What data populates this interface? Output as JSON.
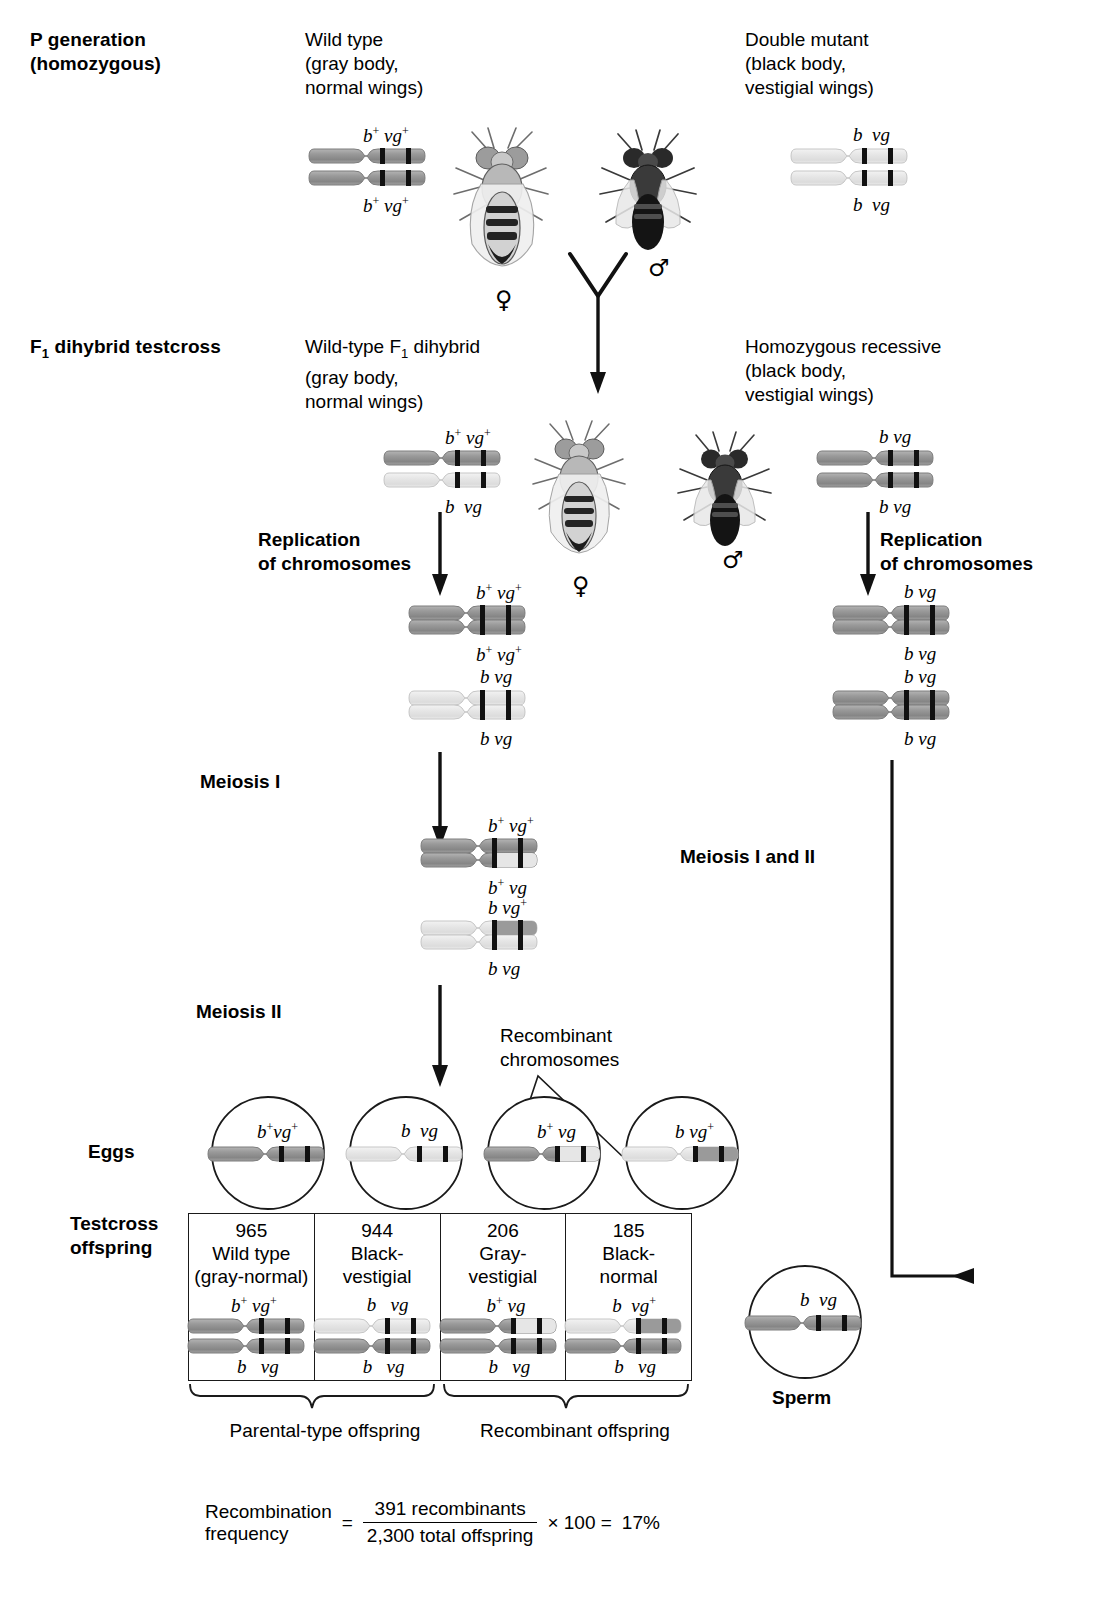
{
  "stages": {
    "p_generation": "P generation\n(homozygous)",
    "p_generation_line1": "P generation",
    "p_generation_line2": "(homozygous)",
    "f1_testcross": "F1 dihybrid testcross",
    "f1_testcross_sub": "1",
    "f1_testcross_pre": "F",
    "f1_testcross_post": " dihybrid testcross"
  },
  "p_gen": {
    "left": {
      "caption_lines": [
        "Wild type",
        "(gray body,",
        "normal wings)"
      ],
      "chromosome_top_label": "b+ vg+",
      "chromosome_bottom_label": "b+ vg+",
      "sex_symbol": "♀",
      "sex_name": "female"
    },
    "right": {
      "caption_lines": [
        "Double mutant",
        "(black body,",
        "vestigial wings)"
      ],
      "chromosome_top_label": "b  vg",
      "chromosome_bottom_label": "b  vg",
      "sex_symbol": "♂",
      "sex_name": "male"
    }
  },
  "f1": {
    "left": {
      "caption_lines": [
        "Wild-type F1 dihybrid",
        "(gray body,",
        "normal wings)"
      ],
      "caption_pre": "Wild-type F",
      "caption_sub": "1",
      "caption_post": " dihybrid",
      "chromosome_top_label": "b+ vg+",
      "chromosome_bottom_label": "b  vg",
      "sex_symbol": "♀"
    },
    "right": {
      "caption_lines": [
        "Homozygous recessive",
        "(black body,",
        "vestigial wings)"
      ],
      "chromosome_top_label": "b vg",
      "chromosome_bottom_label": "b vg",
      "sex_symbol": "♂"
    }
  },
  "steps": {
    "replication_left": [
      "Replication",
      "of chromosomes"
    ],
    "replication_right": [
      "Replication",
      "of chromosomes"
    ],
    "meiosis_i": "Meiosis I",
    "meiosis_ii": "Meiosis II",
    "meiosis_i_and_ii": "Meiosis I and II",
    "recombinant_note": [
      "Recombinant",
      "chromosomes"
    ]
  },
  "replicated_left": {
    "pair1_top": "b+ vg+",
    "pair1_bottom": "b+ vg+",
    "pair2_top": "b vg",
    "pair2_bottom": "b vg"
  },
  "replicated_right": {
    "pair1_top": "b vg",
    "pair1_bottom": "b vg",
    "pair2_top": "b vg",
    "pair2_bottom": "b vg"
  },
  "after_meiosis_i": {
    "pair1_top": "b+ vg+",
    "pair1_bottom": "b+ vg",
    "pair2_top": "b vg+",
    "pair2_bottom": "b vg"
  },
  "eggs": {
    "label": "Eggs",
    "cells": [
      {
        "genotype": "b+vg+",
        "type": "parental"
      },
      {
        "genotype": "b  vg",
        "type": "parental"
      },
      {
        "genotype": "b+ vg",
        "type": "recombinant"
      },
      {
        "genotype": "b vg+",
        "type": "recombinant"
      }
    ]
  },
  "sperm": {
    "label": "Sperm",
    "genotype": "b  vg"
  },
  "testcross": {
    "label_lines": [
      "Testcross",
      "offspring"
    ],
    "columns": [
      {
        "count": "965",
        "name_lines": [
          "Wild type",
          "(gray-normal)"
        ],
        "top_label": "b+ vg+",
        "bottom_label": "b   vg",
        "group": "parental"
      },
      {
        "count": "944",
        "name_lines": [
          "Black-",
          "vestigial"
        ],
        "top_label": "b   vg",
        "bottom_label": "b   vg",
        "group": "parental"
      },
      {
        "count": "206",
        "name_lines": [
          "Gray-",
          "vestigial"
        ],
        "top_label": "b+ vg",
        "bottom_label": "b   vg",
        "group": "recombinant"
      },
      {
        "count": "185",
        "name_lines": [
          "Black-",
          "normal"
        ],
        "top_label": "b  vg+",
        "bottom_label": "b   vg",
        "group": "recombinant"
      }
    ],
    "brace_left_label": "Parental-type offspring",
    "brace_right_label": "Recombinant offspring"
  },
  "recombination": {
    "label_lines": [
      "Recombination",
      "frequency"
    ],
    "equals": "=",
    "numerator": "391 recombinants",
    "denominator": "2,300 total offspring",
    "times": "× 100 =",
    "result": "17%"
  },
  "colors": {
    "chromosome_dark": "#8f8f8f",
    "chromosome_light": "#e2e2e2",
    "chromosome_outline": "#6e6e6e",
    "band": "#111111",
    "line": "#1a1a1a",
    "text": "#000000"
  }
}
